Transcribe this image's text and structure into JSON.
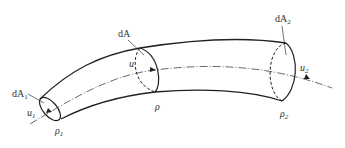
{
  "diagram": {
    "type": "stream-tube",
    "labels": {
      "dA1": {
        "main": "dA",
        "sub": "1"
      },
      "dA": {
        "main": "dA",
        "sub": ""
      },
      "dA2": {
        "main": "dA",
        "sub": "2"
      },
      "u1": {
        "main": "u",
        "sub": "1"
      },
      "u": {
        "main": "u",
        "sub": ""
      },
      "u2": {
        "main": "u",
        "sub": "2"
      },
      "rho1": {
        "main": "ρ",
        "sub": "1"
      },
      "rho": {
        "main": "ρ",
        "sub": ""
      },
      "rho2": {
        "main": "ρ",
        "sub": "2"
      }
    },
    "colors": {
      "stroke": "#222222",
      "axis": "#444444",
      "text": "#333333"
    }
  }
}
